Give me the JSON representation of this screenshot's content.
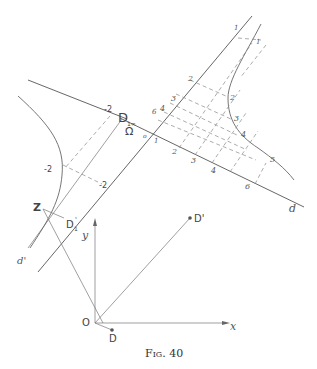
{
  "figure": {
    "caption": "Fig. 40",
    "points": {
      "D_inf": "D",
      "D_inf_sub": "1∞",
      "Omega": "Ω",
      "Z": "Z",
      "D1prime": "D",
      "D1prime_sub": "1",
      "D1prime_mark": "'",
      "Dprime": "D'",
      "O": "O",
      "D": "D"
    },
    "axes": {
      "x": "x",
      "y": "y"
    },
    "lines": {
      "d": "d",
      "d_prime": "d'"
    },
    "scale_d_labels": [
      "o",
      "1",
      "2",
      "3",
      "4",
      "6"
    ],
    "scale_upper_labels": [
      "6",
      "4",
      "3",
      "2",
      "1"
    ],
    "curve_labels": [
      "1",
      "2",
      "3",
      "4",
      "5"
    ],
    "neg_labels": [
      "-2",
      "-2",
      "-2"
    ]
  }
}
